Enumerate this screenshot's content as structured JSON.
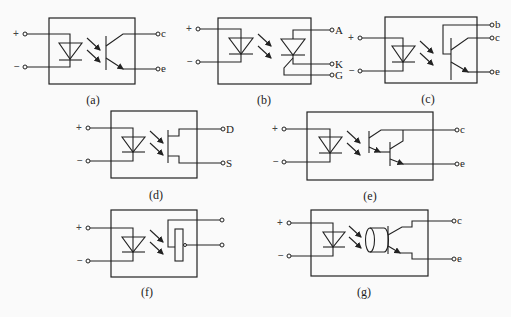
{
  "figure": {
    "panels": [
      {
        "id": "a",
        "caption": "(a)",
        "input_plus": "+",
        "input_minus": "−",
        "outputs": [
          "c",
          "e"
        ],
        "output_device": "phototransistor"
      },
      {
        "id": "b",
        "caption": "(b)",
        "input_plus": "+",
        "input_minus": "−",
        "outputs": [
          "A",
          "K",
          "G"
        ],
        "output_device": "photothyristor"
      },
      {
        "id": "c",
        "caption": "(c)",
        "input_plus": "+",
        "input_minus": "−",
        "outputs": [
          "b",
          "c",
          "e"
        ],
        "output_device": "phototransistor-with-base"
      },
      {
        "id": "d",
        "caption": "(d)",
        "input_plus": "+",
        "input_minus": "−",
        "outputs": [
          "D",
          "S"
        ],
        "output_device": "photo-FET"
      },
      {
        "id": "e",
        "caption": "(e)",
        "input_plus": "+",
        "input_minus": "−",
        "outputs": [
          "c",
          "e"
        ],
        "output_device": "photo-darlington"
      },
      {
        "id": "f",
        "caption": "(f)",
        "input_plus": "+",
        "input_minus": "−",
        "outputs": [
          "",
          ""
        ],
        "output_device": "photoresistor"
      },
      {
        "id": "g",
        "caption": "(g)",
        "input_plus": "+",
        "input_minus": "−",
        "outputs": [
          "c",
          "e"
        ],
        "output_device": "light-pipe-phototransistor"
      }
    ]
  }
}
